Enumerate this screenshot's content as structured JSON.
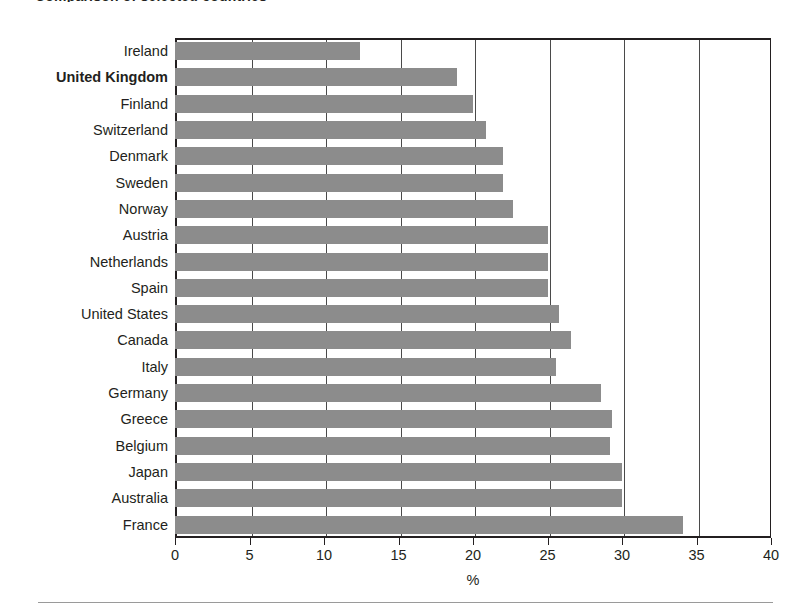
{
  "figure": {
    "title_cropped": "Comparison of selected countries",
    "axis_title_x": "%",
    "bar_color": "#8c8c8c",
    "axis_color": "#231f20",
    "grid_color": "#4a4a4a",
    "highlight_country": "United Kingdom"
  },
  "chart_data": {
    "type": "bar",
    "orientation": "horizontal",
    "title": "",
    "xlabel": "%",
    "ylabel": "",
    "xlim": [
      0,
      40
    ],
    "xticks": [
      0,
      5,
      10,
      15,
      20,
      25,
      30,
      35,
      40
    ],
    "xticklabels": [
      "0",
      "5",
      "10",
      "15",
      "20",
      "25",
      "30",
      "35",
      "40"
    ],
    "grid": "vertical",
    "legend": "none",
    "categories": [
      "Ireland",
      "United Kingdom",
      "Finland",
      "Switzerland",
      "Denmark",
      "Sweden",
      "Norway",
      "Austria",
      "Netherlands",
      "Spain",
      "United States",
      "Canada",
      "Italy",
      "Germany",
      "Greece",
      "Belgium",
      "Japan",
      "Australia",
      "France"
    ],
    "values": [
      12.4,
      18.9,
      20.0,
      20.9,
      22.0,
      22.0,
      22.7,
      25.0,
      25.0,
      25.0,
      25.8,
      26.6,
      25.6,
      28.6,
      29.3,
      29.2,
      30.0,
      30.0,
      34.1
    ],
    "highlighted": [
      "United Kingdom"
    ]
  }
}
